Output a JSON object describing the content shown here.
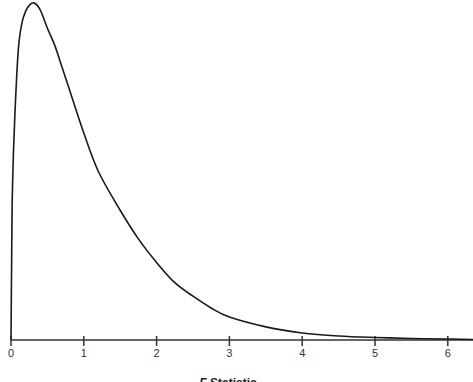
{
  "chart_data": {
    "type": "line",
    "title": "",
    "xlabel": "F Statistic",
    "xlabel_parts": {
      "italic": "F",
      "rest": " Statistic"
    },
    "ylabel": "",
    "xlim": [
      0,
      6.35
    ],
    "ylim": [
      0,
      1
    ],
    "grid": false,
    "legend": null,
    "x_ticks": [
      0,
      1,
      2,
      3,
      4,
      5,
      6
    ],
    "x_tick_labels": [
      "0",
      "1",
      "2",
      "3",
      "4",
      "5",
      "6"
    ],
    "series": [
      {
        "name": "F distribution density (relative)",
        "x": [
          0,
          0.01,
          0.02,
          0.05,
          0.1,
          0.15,
          0.2,
          0.26,
          0.32,
          0.4,
          0.5,
          0.6,
          0.7,
          0.8,
          1.0,
          1.2,
          1.5,
          1.75,
          2.0,
          2.25,
          2.5,
          2.75,
          3.0,
          3.5,
          4.0,
          4.5,
          5.0,
          5.5,
          6.0,
          6.35
        ],
        "y": [
          0,
          0.27,
          0.45,
          0.65,
          0.86,
          0.94,
          0.975,
          0.995,
          1.0,
          0.98,
          0.925,
          0.875,
          0.81,
          0.745,
          0.614,
          0.5,
          0.385,
          0.3,
          0.23,
          0.17,
          0.13,
          0.095,
          0.068,
          0.039,
          0.021,
          0.012,
          0.0075,
          0.0045,
          0.003,
          0.0015
        ],
        "color": "#1a1a1a"
      }
    ]
  }
}
